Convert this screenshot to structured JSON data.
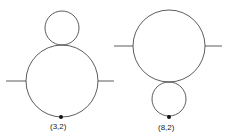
{
  "diagrams": [
    {
      "label": "(3,2)"
    },
    {
      "label": "(8,2)"
    }
  ],
  "stroke_color": "#333333"
}
